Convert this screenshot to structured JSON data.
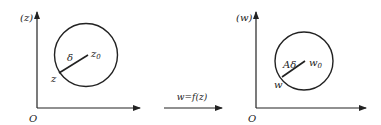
{
  "left_plane": {
    "axis_label": "(z)",
    "origin_label": "O",
    "center_label": "z",
    "center_subscript": "0",
    "point_label": "z",
    "radius_label": "δ"
  },
  "mapping": {
    "label": "w=f(z)"
  },
  "right_plane": {
    "axis_label": "(w)",
    "origin_label": "O",
    "center_label": "w",
    "center_subscript": "0",
    "point_label": "w",
    "radius_label": "Aδ"
  },
  "colors": {
    "stroke": "#222222",
    "background": "#ffffff"
  }
}
